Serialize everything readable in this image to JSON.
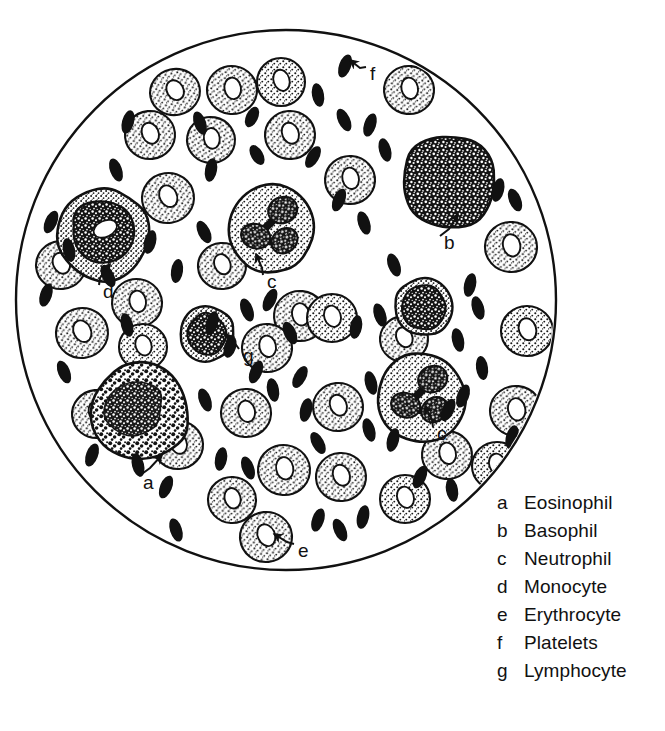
{
  "figure": {
    "background_color": "#ffffff",
    "ink_color": "#111111",
    "field": {
      "shape": "circle",
      "center_x": 286,
      "center_y": 300,
      "radius": 270,
      "stroke_width": 2.4
    }
  },
  "legend": {
    "items": [
      {
        "key": "a",
        "label": "Eosinophil"
      },
      {
        "key": "b",
        "label": "Basophil"
      },
      {
        "key": "c",
        "label": "Neutrophil"
      },
      {
        "key": "d",
        "label": "Monocyte"
      },
      {
        "key": "e",
        "label": "Erythrocyte"
      },
      {
        "key": "f",
        "label": "Platelets"
      },
      {
        "key": "g",
        "label": "Lymphocyte"
      }
    ]
  },
  "callouts": [
    {
      "key": "a",
      "target": "eosinophil",
      "label_x": 143,
      "label_y": 489,
      "tip_x": 150,
      "tip_y": 468,
      "tail_x": 162,
      "tail_y": 455
    },
    {
      "key": "b",
      "target": "basophil",
      "label_x": 444,
      "label_y": 249,
      "tip_x": 449,
      "tip_y": 229,
      "tail_x": 458,
      "tail_y": 214
    },
    {
      "key": "c",
      "target": "neutrophil-upper",
      "label_x": 267,
      "label_y": 288,
      "tip_x": 262,
      "tip_y": 268,
      "tail_x": 256,
      "tail_y": 254
    },
    {
      "key": "c",
      "target": "neutrophil-lower",
      "label_x": 437,
      "label_y": 440,
      "tip_x": 432,
      "tip_y": 420,
      "tail_x": 425,
      "tail_y": 406
    },
    {
      "key": "d",
      "target": "monocyte",
      "label_x": 103,
      "label_y": 298,
      "tip_x": 100,
      "tip_y": 278,
      "tail_x": 110,
      "tail_y": 264
    },
    {
      "key": "e",
      "target": "erythrocyte",
      "label_x": 298,
      "label_y": 557,
      "tip_x": 287,
      "tip_y": 542,
      "tail_x": 274,
      "tail_y": 534
    },
    {
      "key": "f",
      "target": "platelet",
      "label_x": 370,
      "label_y": 80,
      "tip_x": 360,
      "tip_y": 68,
      "tail_x": 350,
      "tail_y": 60
    },
    {
      "key": "g",
      "target": "lymphocyte",
      "label_x": 243,
      "label_y": 362,
      "tip_x": 236,
      "tip_y": 345,
      "tail_x": 226,
      "tail_y": 334
    }
  ],
  "cells": {
    "erythrocytes": [
      {
        "cx": 175,
        "cy": 92,
        "rx": 25,
        "ry": 23,
        "rot": -12
      },
      {
        "cx": 232,
        "cy": 90,
        "rx": 25,
        "ry": 24,
        "rot": 8
      },
      {
        "cx": 281,
        "cy": 82,
        "rx": 24,
        "ry": 24,
        "rot": 0
      },
      {
        "cx": 409,
        "cy": 90,
        "rx": 25,
        "ry": 24,
        "rot": 6
      },
      {
        "cx": 150,
        "cy": 135,
        "rx": 25,
        "ry": 24,
        "rot": -6
      },
      {
        "cx": 211,
        "cy": 140,
        "rx": 24,
        "ry": 23,
        "rot": 10
      },
      {
        "cx": 290,
        "cy": 135,
        "rx": 25,
        "ry": 24,
        "rot": -4
      },
      {
        "cx": 350,
        "cy": 180,
        "rx": 25,
        "ry": 24,
        "rot": 4
      },
      {
        "cx": 168,
        "cy": 198,
        "rx": 26,
        "ry": 25,
        "rot": -8
      },
      {
        "cx": 511,
        "cy": 247,
        "rx": 26,
        "ry": 25,
        "rot": 4
      },
      {
        "cx": 61,
        "cy": 265,
        "rx": 25,
        "ry": 24,
        "rot": -5
      },
      {
        "cx": 137,
        "cy": 303,
        "rx": 25,
        "ry": 24,
        "rot": 8
      },
      {
        "cx": 222,
        "cy": 266,
        "rx": 24,
        "ry": 23,
        "rot": -4
      },
      {
        "cx": 300,
        "cy": 316,
        "rx": 26,
        "ry": 25,
        "rot": 6
      },
      {
        "cx": 332,
        "cy": 318,
        "rx": 25,
        "ry": 24,
        "rot": 0
      },
      {
        "cx": 82,
        "cy": 333,
        "rx": 26,
        "ry": 25,
        "rot": -8
      },
      {
        "cx": 267,
        "cy": 348,
        "rx": 25,
        "ry": 24,
        "rot": 5
      },
      {
        "cx": 527,
        "cy": 331,
        "rx": 26,
        "ry": 25,
        "rot": 0
      },
      {
        "cx": 404,
        "cy": 339,
        "rx": 24,
        "ry": 23,
        "rot": -6
      },
      {
        "cx": 143,
        "cy": 347,
        "rx": 24,
        "ry": 23,
        "rot": 0
      },
      {
        "cx": 246,
        "cy": 413,
        "rx": 25,
        "ry": 24,
        "rot": 4
      },
      {
        "cx": 338,
        "cy": 407,
        "rx": 25,
        "ry": 24,
        "rot": -5
      },
      {
        "cx": 516,
        "cy": 411,
        "rx": 26,
        "ry": 25,
        "rot": 6
      },
      {
        "cx": 178,
        "cy": 445,
        "rx": 25,
        "ry": 24,
        "rot": -3
      },
      {
        "cx": 497,
        "cy": 466,
        "rx": 25,
        "ry": 24,
        "rot": 0
      },
      {
        "cx": 284,
        "cy": 470,
        "rx": 26,
        "ry": 25,
        "rot": 7
      },
      {
        "cx": 341,
        "cy": 477,
        "rx": 25,
        "ry": 24,
        "rot": -4
      },
      {
        "cx": 232,
        "cy": 500,
        "rx": 24,
        "ry": 23,
        "rot": 3
      },
      {
        "cx": 405,
        "cy": 499,
        "rx": 25,
        "ry": 24,
        "rot": 0
      },
      {
        "cx": 266,
        "cy": 537,
        "rx": 26,
        "ry": 25,
        "rot": -6
      },
      {
        "cx": 447,
        "cy": 455,
        "rx": 25,
        "ry": 24,
        "rot": 5
      },
      {
        "cx": 97,
        "cy": 414,
        "rx": 25,
        "ry": 24,
        "rot": -6
      }
    ],
    "platelets": [
      {
        "cx": 128,
        "cy": 122,
        "rx": 6,
        "ry": 12,
        "rot": 15
      },
      {
        "cx": 200,
        "cy": 123,
        "rx": 6,
        "ry": 12,
        "rot": -20
      },
      {
        "cx": 252,
        "cy": 117,
        "rx": 6,
        "ry": 11,
        "rot": 25
      },
      {
        "cx": 318,
        "cy": 95,
        "rx": 6,
        "ry": 12,
        "rot": -10
      },
      {
        "cx": 345,
        "cy": 66,
        "rx": 6,
        "ry": 12,
        "rot": 20
      },
      {
        "cx": 344,
        "cy": 120,
        "rx": 6,
        "ry": 12,
        "rot": -25
      },
      {
        "cx": 370,
        "cy": 125,
        "rx": 6,
        "ry": 12,
        "rot": 18
      },
      {
        "cx": 385,
        "cy": 150,
        "rx": 6,
        "ry": 12,
        "rot": -15
      },
      {
        "cx": 313,
        "cy": 157,
        "rx": 6,
        "ry": 12,
        "rot": 30
      },
      {
        "cx": 116,
        "cy": 170,
        "rx": 6,
        "ry": 12,
        "rot": -20
      },
      {
        "cx": 211,
        "cy": 170,
        "rx": 6,
        "ry": 12,
        "rot": 10
      },
      {
        "cx": 257,
        "cy": 155,
        "rx": 6,
        "ry": 11,
        "rot": -30
      },
      {
        "cx": 339,
        "cy": 200,
        "rx": 6,
        "ry": 12,
        "rot": 22
      },
      {
        "cx": 364,
        "cy": 223,
        "rx": 6,
        "ry": 12,
        "rot": -18
      },
      {
        "cx": 498,
        "cy": 190,
        "rx": 6,
        "ry": 12,
        "rot": 14
      },
      {
        "cx": 515,
        "cy": 200,
        "rx": 6,
        "ry": 12,
        "rot": -22
      },
      {
        "cx": 470,
        "cy": 285,
        "rx": 6,
        "ry": 12,
        "rot": 12
      },
      {
        "cx": 478,
        "cy": 308,
        "rx": 6,
        "ry": 12,
        "rot": -16
      },
      {
        "cx": 51,
        "cy": 222,
        "rx": 6,
        "ry": 12,
        "rot": 24
      },
      {
        "cx": 69,
        "cy": 250,
        "rx": 6,
        "ry": 12,
        "rot": -12
      },
      {
        "cx": 46,
        "cy": 295,
        "rx": 6,
        "ry": 12,
        "rot": 18
      },
      {
        "cx": 108,
        "cy": 276,
        "rx": 6,
        "ry": 12,
        "rot": -26
      },
      {
        "cx": 177,
        "cy": 271,
        "rx": 6,
        "ry": 12,
        "rot": 8
      },
      {
        "cx": 247,
        "cy": 310,
        "rx": 6,
        "ry": 12,
        "rot": -20
      },
      {
        "cx": 270,
        "cy": 300,
        "rx": 6,
        "ry": 12,
        "rot": 25
      },
      {
        "cx": 127,
        "cy": 325,
        "rx": 6,
        "ry": 12,
        "rot": -14
      },
      {
        "cx": 212,
        "cy": 323,
        "rx": 6,
        "ry": 12,
        "rot": 16
      },
      {
        "cx": 290,
        "cy": 333,
        "rx": 6,
        "ry": 12,
        "rot": -24
      },
      {
        "cx": 356,
        "cy": 327,
        "rx": 6,
        "ry": 12,
        "rot": 10
      },
      {
        "cx": 380,
        "cy": 315,
        "rx": 6,
        "ry": 12,
        "rot": -18
      },
      {
        "cx": 256,
        "cy": 372,
        "rx": 6,
        "ry": 12,
        "rot": 22
      },
      {
        "cx": 273,
        "cy": 390,
        "rx": 6,
        "ry": 12,
        "rot": -10
      },
      {
        "cx": 300,
        "cy": 377,
        "rx": 6,
        "ry": 12,
        "rot": 28
      },
      {
        "cx": 205,
        "cy": 400,
        "rx": 6,
        "ry": 12,
        "rot": -20
      },
      {
        "cx": 306,
        "cy": 410,
        "rx": 6,
        "ry": 12,
        "rot": 12
      },
      {
        "cx": 64,
        "cy": 372,
        "rx": 6,
        "ry": 12,
        "rot": -22
      },
      {
        "cx": 230,
        "cy": 347,
        "rx": 6,
        "ry": 11,
        "rot": 18
      },
      {
        "cx": 371,
        "cy": 383,
        "rx": 6,
        "ry": 12,
        "rot": -14
      },
      {
        "cx": 463,
        "cy": 396,
        "rx": 6,
        "ry": 12,
        "rot": 20
      },
      {
        "cx": 482,
        "cy": 368,
        "rx": 6,
        "ry": 12,
        "rot": -8
      },
      {
        "cx": 448,
        "cy": 410,
        "rx": 6,
        "ry": 12,
        "rot": 26
      },
      {
        "cx": 369,
        "cy": 430,
        "rx": 6,
        "ry": 12,
        "rot": -16
      },
      {
        "cx": 393,
        "cy": 440,
        "rx": 6,
        "ry": 12,
        "rot": 14
      },
      {
        "cx": 318,
        "cy": 443,
        "rx": 6,
        "ry": 12,
        "rot": -28
      },
      {
        "cx": 221,
        "cy": 459,
        "rx": 6,
        "ry": 12,
        "rot": 10
      },
      {
        "cx": 248,
        "cy": 468,
        "rx": 6,
        "ry": 12,
        "rot": -20
      },
      {
        "cx": 166,
        "cy": 487,
        "rx": 6,
        "ry": 12,
        "rot": 22
      },
      {
        "cx": 458,
        "cy": 340,
        "rx": 6,
        "ry": 12,
        "rot": -12
      },
      {
        "cx": 318,
        "cy": 520,
        "rx": 6,
        "ry": 12,
        "rot": 18
      },
      {
        "cx": 340,
        "cy": 530,
        "rx": 6,
        "ry": 12,
        "rot": -24
      },
      {
        "cx": 363,
        "cy": 517,
        "rx": 6,
        "ry": 12,
        "rot": 12
      },
      {
        "cx": 176,
        "cy": 530,
        "rx": 6,
        "ry": 12,
        "rot": -18
      },
      {
        "cx": 92,
        "cy": 455,
        "rx": 6,
        "ry": 12,
        "rot": 20
      },
      {
        "cx": 138,
        "cy": 465,
        "rx": 6,
        "ry": 12,
        "rot": -14
      },
      {
        "cx": 420,
        "cy": 477,
        "rx": 6,
        "ry": 12,
        "rot": 24
      },
      {
        "cx": 452,
        "cy": 490,
        "rx": 6,
        "ry": 12,
        "rot": -10
      },
      {
        "cx": 512,
        "cy": 437,
        "rx": 6,
        "ry": 12,
        "rot": 16
      },
      {
        "cx": 204,
        "cy": 232,
        "rx": 6,
        "ry": 12,
        "rot": -26
      },
      {
        "cx": 150,
        "cy": 242,
        "rx": 6,
        "ry": 12,
        "rot": 14
      },
      {
        "cx": 394,
        "cy": 265,
        "rx": 6,
        "ry": 12,
        "rot": -20
      }
    ],
    "leukocytes": [
      {
        "type": "eosinophil",
        "key": "a",
        "cx": 141,
        "cy": 412,
        "r": 50
      },
      {
        "type": "basophil",
        "key": "b",
        "cx": 448,
        "cy": 182,
        "r": 48
      },
      {
        "type": "neutrophil",
        "key": "c",
        "cx": 271,
        "cy": 229,
        "r": 45
      },
      {
        "type": "neutrophil",
        "key": "c",
        "cx": 421,
        "cy": 398,
        "r": 45
      },
      {
        "type": "monocyte",
        "key": "d",
        "cx": 103,
        "cy": 235,
        "r": 47
      },
      {
        "type": "lymphocyte",
        "key": "g",
        "cx": 207,
        "cy": 334,
        "r": 28
      },
      {
        "type": "lymphocyte",
        "key": "",
        "cx": 424,
        "cy": 307,
        "r": 30
      }
    ]
  }
}
